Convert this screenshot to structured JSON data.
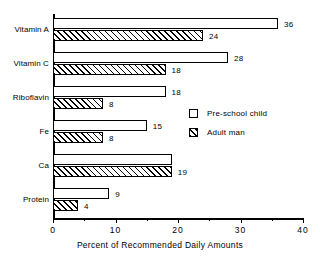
{
  "chart_data": {
    "type": "bar",
    "orientation": "horizontal",
    "title": "",
    "xlabel": "Percent of Recommended Daily Amounts",
    "ylabel": "",
    "xlim": [
      0,
      40
    ],
    "xticks": [
      0,
      10,
      20,
      30,
      40
    ],
    "xtick_labels": [
      "0",
      "10",
      "20",
      "30",
      "40"
    ],
    "minor_xticks": [
      5,
      15,
      25,
      35
    ],
    "grid": false,
    "legend_position": "center-right",
    "categories": [
      "Vitamin A",
      "Vitamin C",
      "Riboflavin",
      "Fe",
      "Ca",
      "Protein"
    ],
    "series": [
      {
        "name": "Pre-school child",
        "fill": "white",
        "values": [
          36,
          28,
          18,
          15,
          19,
          9
        ],
        "value_labels": [
          "36",
          "28",
          "18",
          "15",
          "",
          "9"
        ]
      },
      {
        "name": "Adult man",
        "fill": "hatched",
        "values": [
          24,
          18,
          8,
          8,
          19,
          4
        ],
        "value_labels": [
          "24",
          "18",
          "8",
          "8",
          "19",
          "4"
        ]
      }
    ]
  },
  "legend": {
    "items": [
      {
        "label": "Pre-school child",
        "fill": "white"
      },
      {
        "label": "Adult man",
        "fill": "hatched"
      }
    ]
  },
  "colors": {
    "ink": "#000000",
    "background": "#ffffff"
  }
}
